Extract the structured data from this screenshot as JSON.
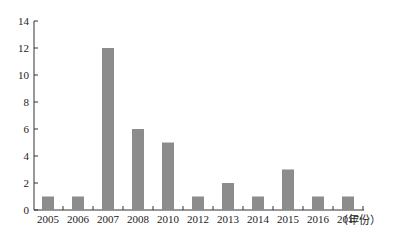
{
  "chart_data": {
    "type": "bar",
    "title": "",
    "xlabel": "（年份）",
    "ylabel": "",
    "categories": [
      "2005",
      "2006",
      "2007",
      "2008",
      "2010",
      "2012",
      "2013",
      "2014",
      "2015",
      "2016",
      "2017"
    ],
    "values": [
      1,
      1,
      12,
      6,
      5,
      1,
      2,
      1,
      3,
      1,
      1
    ],
    "ylim": [
      0,
      14
    ],
    "yticks": [
      0,
      2,
      4,
      6,
      8,
      10,
      12,
      14
    ],
    "grid": false,
    "legend": null,
    "bar_color": "#8c8c8c"
  }
}
